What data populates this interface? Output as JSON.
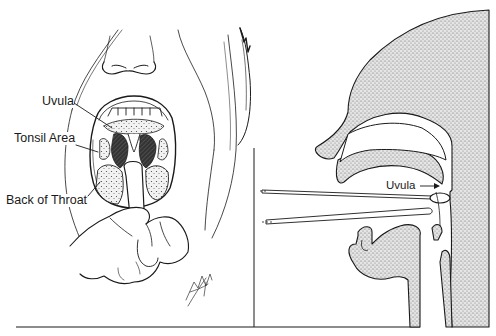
{
  "figure": {
    "left_panel": {
      "title": "Frontal view of open mouth with tongue depressor",
      "labels": [
        {
          "id": "uvula",
          "text": "Uvula"
        },
        {
          "id": "tonsil_area",
          "text": "Tonsil Area"
        },
        {
          "id": "back_of_throat",
          "text": "Back of Throat"
        }
      ],
      "signature": "Finch '90"
    },
    "right_panel": {
      "title": "Sagittal cross-section of head with swab",
      "labels": [
        {
          "id": "uvula",
          "text": "Uvula"
        }
      ]
    },
    "colors": {
      "line": "#1a1a1a",
      "stipple_fill": "#d4d4d4",
      "background": "#ffffff",
      "throat_dark": "#2a2a2a"
    }
  }
}
